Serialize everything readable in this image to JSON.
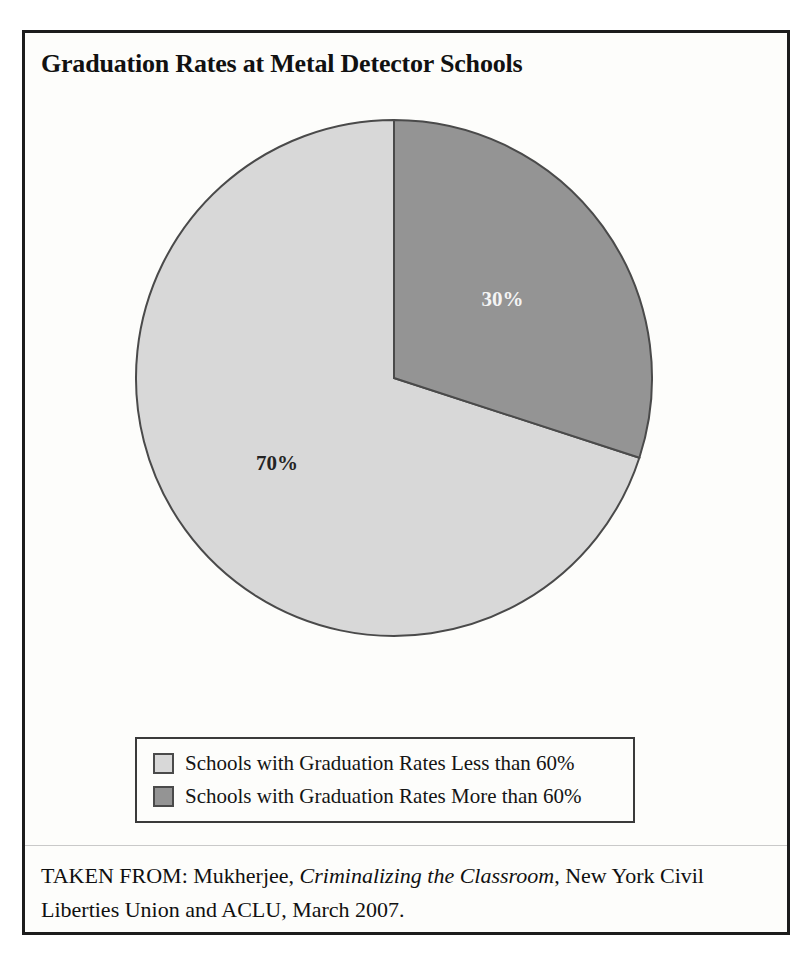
{
  "figure": {
    "title": "Graduation Rates at Metal Detector Schools",
    "source_prefix": "TAKEN FROM: Mukherjee, ",
    "source_book": "Criminalizing the Classroom",
    "source_suffix": ", New York Civil Liberties Union and ACLU, March 2007."
  },
  "colors": {
    "slice_light": "#d8d8d8",
    "slice_dark": "#949494",
    "slice_outline": "#4a4a4a",
    "frame": "#1c1c1c",
    "paper": "#fdfdfb",
    "label_on_dark": "#f4f4f4",
    "label_on_light": "#242424"
  },
  "legend": {
    "items": [
      {
        "label": "Schools with Graduation Rates Less than 60%",
        "swatch": "#d8d8d8"
      },
      {
        "label": "Schools with Graduation Rates More than 60%",
        "swatch": "#949494"
      }
    ]
  },
  "chart_data": {
    "type": "pie",
    "title": "Graduation Rates at Metal Detector Schools",
    "categories": [
      "Schools with Graduation Rates Less than 60%",
      "Schools with Graduation Rates More than 60%"
    ],
    "values": [
      70,
      30
    ],
    "value_labels": [
      "70%",
      "30%"
    ],
    "colors": [
      "#d8d8d8",
      "#949494"
    ],
    "units": "percent",
    "start_angle_deg": 0,
    "direction": "counterclockwise",
    "legend_position": "bottom",
    "grid": false,
    "xlabel": "",
    "ylabel": ""
  }
}
